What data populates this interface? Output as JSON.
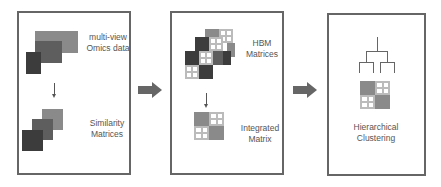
{
  "panels": [
    {
      "id": "omics",
      "top_label": "multi-view\nOmics data",
      "top_label_lines": [
        "multi-view",
        "Omics data"
      ],
      "bottom_label_lines": [
        "Similarity",
        "Matrices"
      ]
    },
    {
      "id": "hbm",
      "top_label_lines": [
        "HBM",
        "Matrices"
      ],
      "bottom_label_lines": [
        "Integrated",
        "Matrix"
      ]
    },
    {
      "id": "clustering",
      "bottom_label_lines": [
        "Hierarchical",
        "Clustering"
      ]
    }
  ],
  "colors": {
    "border": "#666666",
    "dark": "#3c3c3c",
    "mid": "#5e5e5e",
    "light": "#8a8a8a",
    "arrow": "#666666",
    "grid_line": "#bbbbbb"
  },
  "flow": [
    "omics",
    "hbm",
    "clustering"
  ]
}
